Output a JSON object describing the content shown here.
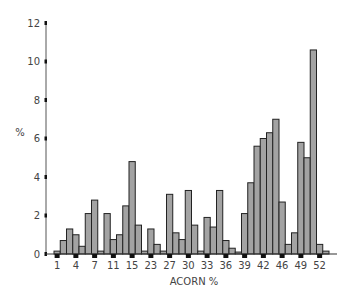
{
  "chart_data": {
    "type": "bar",
    "title": "",
    "xlabel": "ACORN %",
    "ylabel": "%",
    "ylim": [
      0,
      12
    ],
    "yticks": [
      0,
      2,
      4,
      6,
      8,
      10,
      12
    ],
    "xtick_labels": [
      "1",
      "4",
      "7",
      "11",
      "15",
      "23",
      "27",
      "30",
      "33",
      "36",
      "39",
      "42",
      "46",
      "49",
      "52"
    ],
    "xtick_bar_indices": [
      0,
      3,
      6,
      9,
      12,
      15,
      18,
      21,
      24,
      27,
      30,
      33,
      36,
      39,
      42
    ],
    "grid": false,
    "legend": null,
    "values": [
      0.15,
      0.7,
      1.3,
      1.0,
      0.4,
      2.1,
      2.8,
      0.15,
      2.1,
      0.75,
      1.0,
      2.5,
      4.8,
      1.5,
      0.15,
      1.3,
      0.5,
      0.15,
      3.1,
      1.1,
      0.75,
      3.3,
      1.5,
      0.15,
      1.9,
      1.4,
      3.3,
      0.7,
      0.3,
      0.1,
      2.1,
      3.7,
      5.6,
      6.0,
      6.3,
      7.0,
      2.7,
      0.5,
      1.1,
      5.8,
      5.0,
      10.6,
      0.5,
      0.15
    ],
    "bar_color": "#a3a3a3",
    "bar_outline": "#222222"
  }
}
